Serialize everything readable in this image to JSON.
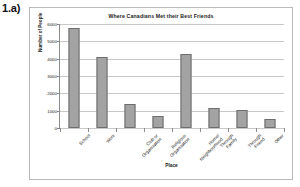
{
  "question_label": "1.a)",
  "chart_data": {
    "type": "bar",
    "title": "Where Canadians Met their Best Friends",
    "xlabel": "Place",
    "ylabel": "Number of People",
    "categories": [
      "School",
      "Work",
      "Club or Organization",
      "Religious Organization",
      "Home/Neighbourhood",
      "Through Family",
      "Through Friend",
      "Other"
    ],
    "values": [
      5750,
      4100,
      1400,
      680,
      4250,
      1150,
      1040,
      520
    ],
    "ylim": [
      0,
      6000
    ],
    "yticks": [
      0,
      1000,
      2000,
      3000,
      4000,
      5000,
      6000
    ],
    "ytick_labels": [
      "0",
      "1000",
      "2000",
      "3000",
      "4000",
      "5000",
      "6000"
    ],
    "grid": true,
    "legend": false,
    "bar_color": "#a3a3a3",
    "bar_border_color": "#6d6d6d",
    "gridline_color": "#c8c8c8",
    "axis_color": "#8a8a8a",
    "frame_color": "#b9b9b9",
    "background": "#ffffff"
  }
}
